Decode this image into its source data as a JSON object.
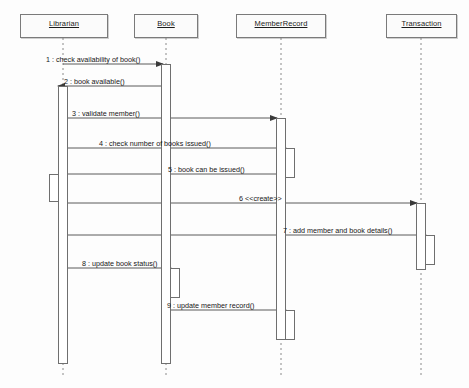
{
  "diagram": {
    "type": "uml-sequence-diagram",
    "width": 469,
    "height": 388,
    "background_color": "#fdfdfd",
    "line_color": "#6f6f6f",
    "text_color": "#161616"
  },
  "lifelines": [
    {
      "id": "librarian",
      "label": "Librarian",
      "center_x": 63,
      "box": {
        "x": 20,
        "y": 14,
        "width": 88,
        "height": 24
      },
      "lifeline_top": 38,
      "lifeline_bottom": 378
    },
    {
      "id": "book",
      "label": "Book",
      "center_x": 166,
      "box": {
        "x": 134,
        "y": 14,
        "width": 64,
        "height": 24
      },
      "lifeline_top": 38,
      "lifeline_bottom": 378
    },
    {
      "id": "memberrecord",
      "label": "MemberRecord",
      "center_x": 281,
      "box": {
        "x": 236,
        "y": 14,
        "width": 90,
        "height": 24
      },
      "lifeline_top": 38,
      "lifeline_bottom": 378
    },
    {
      "id": "transaction",
      "label": "Transaction",
      "center_x": 421,
      "box": {
        "x": 386,
        "y": 14,
        "width": 71,
        "height": 24
      },
      "lifeline_top": 38,
      "lifeline_bottom": 378
    }
  ],
  "activations": [
    {
      "id": "act-librarian-main",
      "lifeline": "librarian",
      "x": 58,
      "y": 86,
      "width": 10,
      "height": 278,
      "nested": false
    },
    {
      "id": "act-librarian-return",
      "lifeline": "librarian",
      "x": 49,
      "y": 174,
      "width": 10,
      "height": 28,
      "nested": true
    },
    {
      "id": "act-book-main",
      "lifeline": "book",
      "x": 161,
      "y": 64,
      "width": 10,
      "height": 300,
      "nested": false
    },
    {
      "id": "act-book-nested",
      "lifeline": "book",
      "x": 170,
      "y": 268,
      "width": 10,
      "height": 30,
      "nested": true
    },
    {
      "id": "act-member-main",
      "lifeline": "memberrecord",
      "x": 276,
      "y": 118,
      "width": 10,
      "height": 222,
      "nested": false
    },
    {
      "id": "act-member-nested-1",
      "lifeline": "memberrecord",
      "x": 285,
      "y": 148,
      "width": 10,
      "height": 30,
      "nested": true
    },
    {
      "id": "act-member-nested-2",
      "lifeline": "memberrecord",
      "x": 285,
      "y": 310,
      "width": 10,
      "height": 30,
      "nested": true
    },
    {
      "id": "act-transaction-main",
      "lifeline": "transaction",
      "x": 416,
      "y": 203,
      "width": 10,
      "height": 67,
      "nested": false
    },
    {
      "id": "act-transaction-nested",
      "lifeline": "transaction",
      "x": 425,
      "y": 235,
      "width": 10,
      "height": 30,
      "nested": true
    }
  ],
  "messages": [
    {
      "number": "1",
      "label": "1 : check availability of book()",
      "from": "librarian",
      "to": "book",
      "y": 64,
      "x1": 63,
      "x2": 163,
      "direction": "right",
      "label_x": 46,
      "label_y": 55,
      "style": "solid"
    },
    {
      "number": "2",
      "label": "2 : book available()",
      "from": "book",
      "to": "librarian",
      "y": 86,
      "x1": 161,
      "x2": 58,
      "direction": "left",
      "label_x": 64,
      "label_y": 77,
      "style": "solid"
    },
    {
      "number": "3",
      "label": "3 : validate member()",
      "from": "librarian",
      "to": "memberrecord",
      "y": 118,
      "x1": 68,
      "x2": 277,
      "direction": "right",
      "label_x": 72,
      "label_y": 109,
      "style": "solid"
    },
    {
      "number": "4",
      "label": "4 : check number of books issued()",
      "from": "librarian",
      "to": "memberrecord",
      "y": 148,
      "x1": 68,
      "x2": 286,
      "direction": "right",
      "label_x": 99,
      "label_y": 139,
      "style": "solid"
    },
    {
      "number": "5",
      "label": "5 : book can be issued()",
      "from": "memberrecord",
      "to": "librarian",
      "y": 174,
      "x1": 285,
      "x2": 60,
      "direction": "left",
      "label_x": 168,
      "label_y": 165,
      "style": "solid"
    },
    {
      "number": "6",
      "label": "6 <<create>>",
      "from": "librarian",
      "to": "transaction",
      "y": 203,
      "x1": 68,
      "x2": 417,
      "direction": "right",
      "label_x": 239,
      "label_y": 194,
      "style": "solid"
    },
    {
      "number": "7",
      "label": "7 : add member and book details()",
      "from": "librarian",
      "to": "transaction",
      "y": 235,
      "x1": 68,
      "x2": 426,
      "direction": "right",
      "label_x": 283,
      "label_y": 226,
      "style": "solid"
    },
    {
      "number": "8",
      "label": "8 : update book status()",
      "from": "librarian",
      "to": "book",
      "y": 268,
      "x1": 68,
      "x2": 171,
      "direction": "right",
      "label_x": 82,
      "label_y": 259,
      "style": "solid"
    },
    {
      "number": "9",
      "label": "9 : update member record()",
      "from": "book",
      "to": "memberrecord",
      "y": 310,
      "x1": 171,
      "x2": 286,
      "direction": "right",
      "label_x": 167,
      "label_y": 301,
      "style": "solid"
    }
  ]
}
